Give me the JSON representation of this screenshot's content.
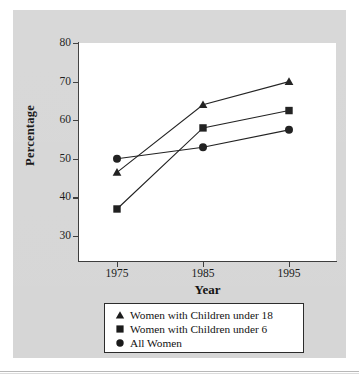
{
  "chart_data": {
    "type": "line",
    "title": "",
    "subtitle": "",
    "xlabel": "Year",
    "ylabel": "Percentage",
    "categories": [
      "1975",
      "1985",
      "1995"
    ],
    "x": [
      1975,
      1985,
      1995
    ],
    "xlim": [
      1970,
      2000
    ],
    "ylim": [
      25,
      80
    ],
    "yticks": [
      30,
      40,
      50,
      60,
      70,
      80
    ],
    "xticks": [
      1975,
      1985,
      1995
    ],
    "grid": false,
    "legend_position": "below-plot",
    "series": [
      {
        "name": "Women with Children under 18",
        "marker": "triangle",
        "values": [
          46.5,
          64.0,
          70.0
        ]
      },
      {
        "name": "Women with Children under 6",
        "marker": "square",
        "values": [
          37.0,
          58.0,
          62.5
        ]
      },
      {
        "name": "All Women",
        "marker": "circle",
        "values": [
          50.0,
          53.0,
          57.5
        ]
      }
    ]
  },
  "axes": {
    "y_title": "Percentage",
    "x_title": "Year",
    "y_tick_labels": [
      "80",
      "70",
      "60",
      "50",
      "40",
      "30"
    ],
    "x_tick_labels": [
      "1975",
      "1985",
      "1995"
    ]
  },
  "legend": {
    "items": [
      {
        "marker": "triangle-marker",
        "label": "Women with Children under 18"
      },
      {
        "marker": "square-marker",
        "label": "Women with Children under 6"
      },
      {
        "marker": "circle-marker",
        "label": "All Women"
      }
    ]
  },
  "colors": {
    "figure_background": "#d6d6d6",
    "plot_background": "#ffffff",
    "ink": "#161616",
    "axis": "#3a3a3a",
    "series": "#1a1a1a"
  }
}
